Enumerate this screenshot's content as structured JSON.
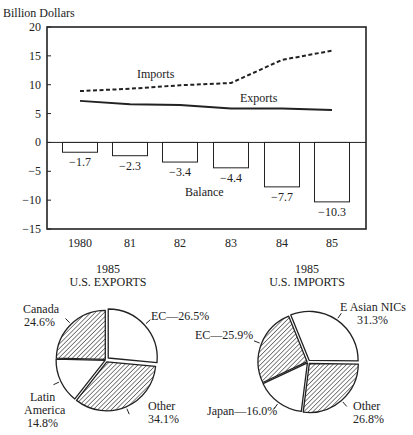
{
  "chart_data": [
    {
      "type": "line+bar",
      "title": "",
      "ylabel": "Billion Dollars",
      "xlabel": "",
      "ylim": [
        -15,
        20
      ],
      "yticks": [
        20,
        15,
        10,
        5,
        0,
        -5,
        -10,
        -15
      ],
      "ytick_labels": [
        "20",
        "15",
        "10",
        "5",
        "0",
        "−5",
        "−10",
        "−15"
      ],
      "categories": [
        "1980",
        "81",
        "82",
        "83",
        "84",
        "85"
      ],
      "grid": false,
      "series": [
        {
          "name": "Imports",
          "type": "line",
          "style": "dashed",
          "values": [
            8.9,
            9.3,
            9.9,
            10.3,
            14.3,
            15.9
          ]
        },
        {
          "name": "Exports",
          "type": "line",
          "style": "solid",
          "values": [
            7.2,
            6.6,
            6.5,
            5.9,
            5.9,
            5.6
          ]
        },
        {
          "name": "Balance",
          "type": "bar",
          "values": [
            -1.7,
            -2.3,
            -3.4,
            -4.4,
            -7.7,
            -10.3
          ],
          "labels": [
            "−1.7",
            "−2.3",
            "−3.4",
            "−4.4",
            "−7.7",
            "−10.3"
          ]
        }
      ]
    },
    {
      "type": "pie",
      "title": "1985",
      "subtitle": "U.S. EXPORTS",
      "slices": [
        {
          "label": "EC—26.5%",
          "name": "EC",
          "value": 26.5,
          "fill": "white"
        },
        {
          "label": "Other 34.1%",
          "name": "Other",
          "value": 34.1,
          "fill": "hatched"
        },
        {
          "label": "Latin America 14.8%",
          "name": "Latin America",
          "value": 14.8,
          "fill": "white"
        },
        {
          "label": "Canada 24.6%",
          "name": "Canada",
          "value": 24.6,
          "fill": "hatched"
        }
      ]
    },
    {
      "type": "pie",
      "title": "1985",
      "subtitle": "U.S. IMPORTS",
      "slices": [
        {
          "label": "E Asian NICs 31.3%",
          "name": "E Asian NICs",
          "value": 31.3,
          "fill": "white"
        },
        {
          "label": "Other 26.8%",
          "name": "Other",
          "value": 26.8,
          "fill": "hatched"
        },
        {
          "label": "Japan—16.0%",
          "name": "Japan",
          "value": 16.0,
          "fill": "white"
        },
        {
          "label": "EC—25.9%",
          "name": "EC",
          "value": 25.9,
          "fill": "hatched"
        }
      ]
    }
  ],
  "labels": {
    "yaxis_title": "Billion Dollars",
    "imports": "Imports",
    "exports": "Exports",
    "balance": "Balance",
    "exports_pie_year": "1985",
    "exports_pie_title": "U.S. EXPORTS",
    "imports_pie_year": "1985",
    "imports_pie_title": "U.S. IMPORTS",
    "exp_ec": "EC—26.5%",
    "exp_canada_1": "Canada",
    "exp_canada_2": "24.6%",
    "exp_latam_1": "Latin",
    "exp_latam_2": "America",
    "exp_latam_3": "14.8%",
    "exp_other_1": "Other",
    "exp_other_2": "34.1%",
    "imp_nics_1": "E Asian NICs",
    "imp_nics_2": "31.3%",
    "imp_ec": "EC—25.9%",
    "imp_japan": "Japan—16.0%",
    "imp_other_1": "Other",
    "imp_other_2": "26.8%"
  },
  "colors": {
    "ink": "#222222",
    "background": "#ffffff"
  }
}
